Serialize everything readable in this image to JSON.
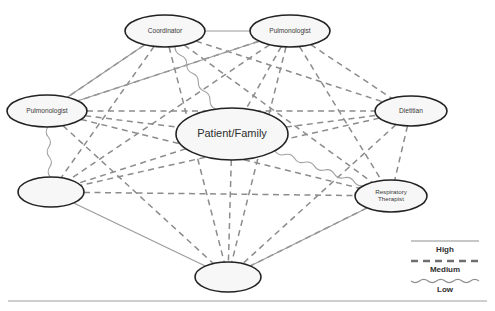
{
  "diagram": {
    "type": "network",
    "canvas": {
      "width": 495,
      "height": 311
    },
    "nodes": [
      {
        "id": "coordinator",
        "label": "Coordinator",
        "label_lines": [
          "Coordinator"
        ],
        "cx": 165,
        "cy": 31,
        "rx": 40,
        "ry": 16
      },
      {
        "id": "pulmonologist_top",
        "label": "Pulmonologist",
        "label_lines": [
          "Pulmonologist"
        ],
        "cx": 290,
        "cy": 31,
        "rx": 40,
        "ry": 16
      },
      {
        "id": "pulmonologist_left",
        "label": "Pulmonologist",
        "label_lines": [
          "Pulmonologist"
        ],
        "cx": 47,
        "cy": 111,
        "rx": 40,
        "ry": 16
      },
      {
        "id": "dietitian",
        "label": "Dietitian",
        "label_lines": [
          "Dietitian"
        ],
        "cx": 411,
        "cy": 111,
        "rx": 36,
        "ry": 15
      },
      {
        "id": "patient_family",
        "label": "Patient/Family",
        "label_lines": [
          "Patient/Family"
        ],
        "cx": 232,
        "cy": 134,
        "rx": 56,
        "ry": 26
      },
      {
        "id": "unlabeled_left",
        "label": "",
        "label_lines": [],
        "cx": 51,
        "cy": 192,
        "rx": 33,
        "ry": 15
      },
      {
        "id": "respiratory_therapist",
        "label": "Respiratory Therapist",
        "label_lines": [
          "Respiratory",
          "Therapist"
        ],
        "cx": 391,
        "cy": 196,
        "rx": 36,
        "ry": 16
      },
      {
        "id": "unlabeled_bottom",
        "label": "",
        "label_lines": [],
        "cx": 228,
        "cy": 277,
        "rx": 33,
        "ry": 15
      }
    ],
    "edges": [
      {
        "source": "coordinator",
        "target": "pulmonologist_top",
        "strength": "High"
      },
      {
        "source": "pulmonologist_left",
        "target": "coordinator",
        "strength": "High"
      },
      {
        "source": "pulmonologist_left",
        "target": "pulmonologist_top",
        "strength": "High"
      },
      {
        "source": "unlabeled_left",
        "target": "unlabeled_bottom",
        "strength": "High"
      },
      {
        "source": "unlabeled_bottom",
        "target": "respiratory_therapist",
        "strength": "High"
      },
      {
        "source": "coordinator",
        "target": "pulmonologist_left",
        "strength": "Medium"
      },
      {
        "source": "coordinator",
        "target": "dietitian",
        "strength": "Medium"
      },
      {
        "source": "coordinator",
        "target": "unlabeled_left",
        "strength": "Medium"
      },
      {
        "source": "coordinator",
        "target": "respiratory_therapist",
        "strength": "Medium"
      },
      {
        "source": "coordinator",
        "target": "unlabeled_bottom",
        "strength": "Medium"
      },
      {
        "source": "pulmonologist_top",
        "target": "pulmonologist_left",
        "strength": "Medium"
      },
      {
        "source": "pulmonologist_top",
        "target": "patient_family",
        "strength": "Medium"
      },
      {
        "source": "pulmonologist_top",
        "target": "dietitian",
        "strength": "Medium"
      },
      {
        "source": "pulmonologist_top",
        "target": "unlabeled_left",
        "strength": "Medium"
      },
      {
        "source": "pulmonologist_top",
        "target": "respiratory_therapist",
        "strength": "Medium"
      },
      {
        "source": "pulmonologist_top",
        "target": "unlabeled_bottom",
        "strength": "Medium"
      },
      {
        "source": "pulmonologist_left",
        "target": "patient_family",
        "strength": "Medium"
      },
      {
        "source": "pulmonologist_left",
        "target": "dietitian",
        "strength": "Medium"
      },
      {
        "source": "pulmonologist_left",
        "target": "respiratory_therapist",
        "strength": "Medium"
      },
      {
        "source": "pulmonologist_left",
        "target": "unlabeled_bottom",
        "strength": "Medium"
      },
      {
        "source": "patient_family",
        "target": "dietitian",
        "strength": "Medium"
      },
      {
        "source": "patient_family",
        "target": "unlabeled_left",
        "strength": "Medium"
      },
      {
        "source": "patient_family",
        "target": "unlabeled_bottom",
        "strength": "Medium"
      },
      {
        "source": "dietitian",
        "target": "unlabeled_left",
        "strength": "Medium"
      },
      {
        "source": "dietitian",
        "target": "respiratory_therapist",
        "strength": "Medium"
      },
      {
        "source": "dietitian",
        "target": "unlabeled_bottom",
        "strength": "Medium"
      },
      {
        "source": "unlabeled_left",
        "target": "respiratory_therapist",
        "strength": "Medium"
      },
      {
        "source": "respiratory_therapist",
        "target": "unlabeled_bottom",
        "strength": "Medium"
      },
      {
        "source": "coordinator",
        "target": "patient_family",
        "strength": "Low"
      },
      {
        "source": "pulmonologist_left",
        "target": "unlabeled_left",
        "strength": "Low"
      },
      {
        "source": "patient_family",
        "target": "respiratory_therapist",
        "strength": "Low"
      }
    ]
  },
  "legend": {
    "title": "Tie strength",
    "items": [
      {
        "label": "High",
        "style": "solid"
      },
      {
        "label": "Medium",
        "style": "dashed"
      },
      {
        "label": "Low",
        "style": "wavy"
      }
    ]
  },
  "colors": {
    "node_fill": "#f7f7f7",
    "node_stroke": "#222222",
    "edge_high": "#9a9a9a",
    "edge_medium": "#8c8c8c",
    "edge_low": "#a2a2a2",
    "label_text": "#3a3a3a",
    "rule": "#9f9f9f"
  }
}
